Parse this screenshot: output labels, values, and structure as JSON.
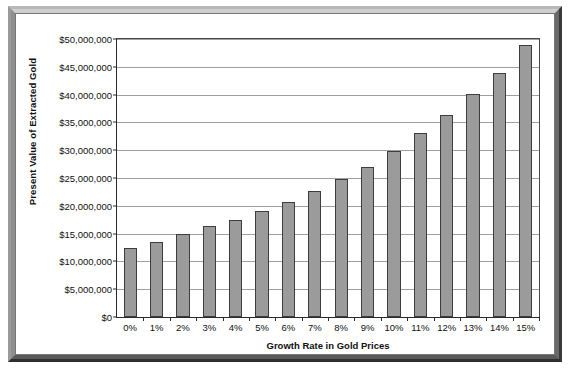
{
  "chart_data": {
    "type": "bar",
    "title": "",
    "xlabel": "Growth Rate in Gold Prices",
    "ylabel": "Present Value of Extracted Gold",
    "categories": [
      "0%",
      "1%",
      "2%",
      "3%",
      "4%",
      "5%",
      "6%",
      "7%",
      "8%",
      "9%",
      "10%",
      "11%",
      "12%",
      "13%",
      "14%",
      "15%"
    ],
    "values": [
      12400000,
      13550000,
      14900000,
      16350000,
      17450000,
      19050000,
      20650000,
      22700000,
      24750000,
      27050000,
      29900000,
      33050000,
      36350000,
      40100000,
      43900000,
      48900000
    ],
    "ylim": [
      0,
      50000000
    ],
    "ytick_values": [
      0,
      5000000,
      10000000,
      15000000,
      20000000,
      25000000,
      30000000,
      35000000,
      40000000,
      45000000,
      50000000
    ],
    "ytick_labels": [
      "$0",
      "$5,000,000",
      "$10,000,000",
      "$15,000,000",
      "$20,000,000",
      "$25,000,000",
      "$30,000,000",
      "$35,000,000",
      "$40,000,000",
      "$45,000,000",
      "$50,000,000"
    ],
    "grid": true,
    "legend": false,
    "bar_color": "#9b9b9b",
    "bar_border_color": "#3d3d3d",
    "gridline_color": "#9f9f9f",
    "axis_color": "#2a2a2a",
    "plot_background": "#ffffff"
  }
}
